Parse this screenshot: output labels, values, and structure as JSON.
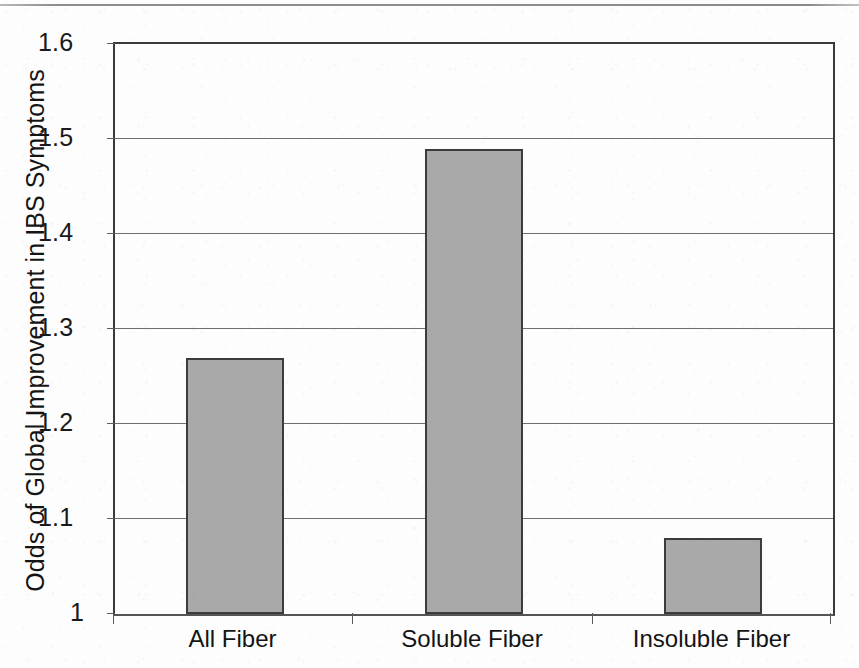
{
  "chart_data": {
    "type": "bar",
    "title": "",
    "subtitle": "",
    "xlabel": "",
    "ylabel": "Odds of Global Improvement in IBS Symptoms",
    "categories": [
      "All Fiber",
      "Soluble Fiber",
      "Insoluble Fiber"
    ],
    "values": [
      1.27,
      1.49,
      1.08
    ],
    "ylim": [
      1,
      1.6
    ],
    "ytick_values": [
      1,
      1.1,
      1.2,
      1.3,
      1.4,
      1.5,
      1.6
    ],
    "ytick_labels": [
      "1",
      "1.1",
      "1.2",
      "1.3",
      "1.4",
      "1.5",
      "1.6"
    ],
    "grid": "horizontal",
    "legend": "none",
    "series": [
      {
        "name": "Odds of Global Improvement in IBS Symptoms",
        "values": [
          1.27,
          1.49,
          1.08
        ]
      }
    ],
    "bar_fill_color": "#a9a9a9",
    "bar_border_color": "#3c3c3c",
    "axis_color": "#3a3a3a",
    "gridline_color": "#6f6f6f",
    "background_color": "#fdfdfd"
  },
  "axis": {
    "y_title": "Odds of Global Improvement in IBS Symptoms",
    "ticks": [
      {
        "label": "1.6",
        "value": 1.6
      },
      {
        "label": "1.5",
        "value": 1.5
      },
      {
        "label": "1.4",
        "value": 1.4
      },
      {
        "label": "1.3",
        "value": 1.3
      },
      {
        "label": "1.2",
        "value": 1.2
      },
      {
        "label": "1.1",
        "value": 1.1
      },
      {
        "label": "1",
        "value": 1
      }
    ]
  },
  "categories": [
    {
      "label": "All Fiber",
      "value": 1.27
    },
    {
      "label": "Soluble Fiber",
      "value": 1.49
    },
    {
      "label": "Insoluble Fiber",
      "value": 1.08
    }
  ]
}
